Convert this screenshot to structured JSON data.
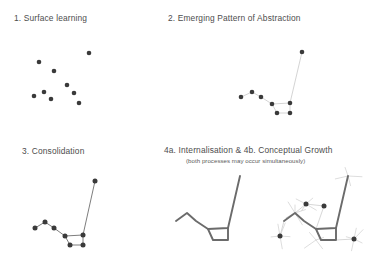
{
  "figure": {
    "background": "#ffffff",
    "dot_color": "#3a3a3a",
    "faint_line_color": "#c9c9c9",
    "strong_line_color": "#6e6e6e",
    "bold_line_color": "#6b6b6b",
    "ray_color": "#d2d2d2"
  },
  "panels": {
    "p1": {
      "title": "1. Surface learning"
    },
    "p2": {
      "title": "2. Emerging Pattern of Abstraction"
    },
    "p3": {
      "title": "3. Consolidation"
    },
    "p4": {
      "title": "4a. Internalisation  &  4b. Conceptual Growth",
      "subtitle": "(both processes may occur simultaneously)"
    }
  },
  "chart_data": {
    "type": "scatter",
    "xlabel": "",
    "ylabel": "",
    "xlim": [
      0,
      390
    ],
    "ylim": [
      0,
      275
    ],
    "grid": false,
    "legend": "none",
    "annotations": [
      "1. Surface learning",
      "2. Emerging Pattern of Abstraction",
      "3. Consolidation",
      "4a. Internalisation  &  4b. Conceptual Growth",
      "(both processes may occur simultaneously)"
    ],
    "series": [
      {
        "name": "1. Surface learning - scattered points",
        "type": "scatter",
        "marker_size": 2.3,
        "color": "#3a3a3a",
        "points": [
          [
            89,
            53
          ],
          [
            39,
            62
          ],
          [
            54,
            71
          ],
          [
            67,
            85
          ],
          [
            34,
            96
          ],
          [
            44,
            92
          ],
          [
            51,
            99
          ],
          [
            74,
            93
          ],
          [
            79,
            103
          ]
        ]
      },
      {
        "name": "2. Emerging Pattern of Abstraction - points",
        "type": "scatter",
        "marker_size": 2.3,
        "color": "#3a3a3a",
        "points": [
          [
            302,
            52
          ],
          [
            241,
            97
          ],
          [
            252,
            92
          ],
          [
            261,
            97
          ],
          [
            272,
            104
          ],
          [
            290,
            103
          ],
          [
            277,
            113
          ],
          [
            290,
            113
          ]
        ]
      },
      {
        "name": "2. Emerging Pattern of Abstraction - faint links",
        "type": "line",
        "color": "#c9c9c9",
        "width": 0.8,
        "path": [
          [
            241,
            97
          ],
          [
            252,
            92
          ],
          [
            261,
            97
          ],
          [
            272,
            104
          ],
          [
            290,
            103
          ],
          [
            302,
            52
          ]
        ],
        "extra_paths": [
          [
            [
              272,
              104
            ],
            [
              277,
              113
            ],
            [
              290,
              113
            ],
            [
              290,
              103
            ]
          ]
        ]
      },
      {
        "name": "3. Consolidation - points",
        "type": "scatter",
        "marker_size": 2.5,
        "color": "#3a3a3a",
        "points": [
          [
            95,
            181
          ],
          [
            35,
            228
          ],
          [
            45,
            222
          ],
          [
            54,
            228
          ],
          [
            65,
            236
          ],
          [
            83,
            235
          ],
          [
            70,
            245
          ],
          [
            83,
            245
          ]
        ]
      },
      {
        "name": "3. Consolidation - strong links",
        "type": "line",
        "color": "#6e6e6e",
        "width": 0.9,
        "path": [
          [
            35,
            228
          ],
          [
            45,
            222
          ],
          [
            54,
            228
          ],
          [
            65,
            236
          ],
          [
            83,
            235
          ],
          [
            95,
            181
          ]
        ],
        "extra_paths": [
          [
            [
              65,
              236
            ],
            [
              70,
              245
            ],
            [
              83,
              245
            ],
            [
              83,
              235
            ]
          ]
        ]
      },
      {
        "name": "4a. Internalisation - bold outline, no points",
        "type": "line",
        "color": "#6b6b6b",
        "width": 1.9,
        "path": [
          [
            176,
            221
          ],
          [
            187,
            213
          ],
          [
            196,
            221
          ],
          [
            208,
            229
          ],
          [
            228,
            228
          ],
          [
            240,
            176
          ]
        ],
        "extra_paths": [
          [
            [
              208,
              229
            ],
            [
              213,
              240
            ],
            [
              228,
              240
            ],
            [
              228,
              228
            ]
          ]
        ]
      },
      {
        "name": "4b. Conceptual Growth - bold outline",
        "type": "line",
        "color": "#6b6b6b",
        "width": 1.9,
        "path": [
          [
            284,
            221
          ],
          [
            295,
            213
          ],
          [
            304,
            221
          ],
          [
            316,
            229
          ],
          [
            336,
            228
          ],
          [
            348,
            176
          ]
        ],
        "extra_paths": [
          [
            [
              316,
              229
            ],
            [
              321,
              240
            ],
            [
              336,
              240
            ],
            [
              336,
              228
            ]
          ]
        ]
      },
      {
        "name": "4b. Conceptual Growth - new points",
        "type": "scatter",
        "marker_size": 2.5,
        "color": "#3a3a3a",
        "points": [
          [
            306,
            204
          ],
          [
            324,
            206
          ],
          [
            280,
            236
          ],
          [
            354,
            239
          ]
        ]
      },
      {
        "name": "4b. Conceptual Growth - new faint links",
        "type": "line",
        "color": "#cdcdcd",
        "width": 0.8,
        "path": [
          [
            295,
            213
          ],
          [
            306,
            204
          ],
          [
            324,
            206
          ],
          [
            316,
            229
          ]
        ],
        "extra_paths": [
          [
            [
              295,
              213
            ],
            [
              284,
              221
            ],
            [
              280,
              236
            ]
          ],
          [
            [
              336,
              240
            ],
            [
              354,
              239
            ]
          ]
        ]
      },
      {
        "name": "4b. Conceptual Growth - radiating growth rays",
        "type": "line",
        "color": "#d2d2d2",
        "width": 0.75,
        "ray_origins": [
          [
            295,
            213
          ],
          [
            306,
            204
          ],
          [
            280,
            236
          ],
          [
            316,
            240
          ],
          [
            354,
            239
          ],
          [
            348,
            176
          ]
        ]
      }
    ]
  }
}
